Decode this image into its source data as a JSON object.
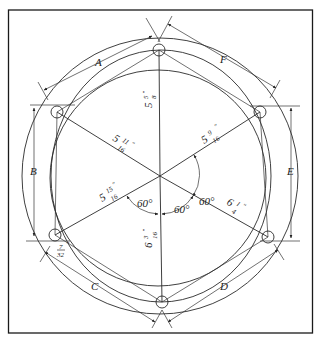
{
  "diagram": {
    "type": "bolt-circle-layout",
    "labels": {
      "chord_a": "A",
      "chord_b": "B",
      "chord_c": "C",
      "chord_d": "D",
      "chord_e": "E",
      "chord_f": "F"
    },
    "radii": {
      "top": {
        "whole": "5",
        "num": "5",
        "den": "8",
        "unit": "\""
      },
      "upper_left": {
        "whole": "5",
        "num": "11",
        "den": "16",
        "unit": "\""
      },
      "upper_right": {
        "whole": "5",
        "num": "9",
        "den": "16",
        "unit": "\""
      },
      "lower_left": {
        "whole": "5",
        "num": "15",
        "den": "16",
        "unit": "\""
      },
      "lower_right": {
        "whole": "6",
        "num": "1",
        "den": "4",
        "unit": "\""
      },
      "bottom": {
        "whole": "6",
        "num": "3",
        "den": "16",
        "unit": "\""
      }
    },
    "angles": {
      "right": "60°",
      "lower_right": "60°",
      "lower_left": "60°"
    },
    "offset": {
      "num": "7",
      "den": "32",
      "unit": "\""
    }
  }
}
